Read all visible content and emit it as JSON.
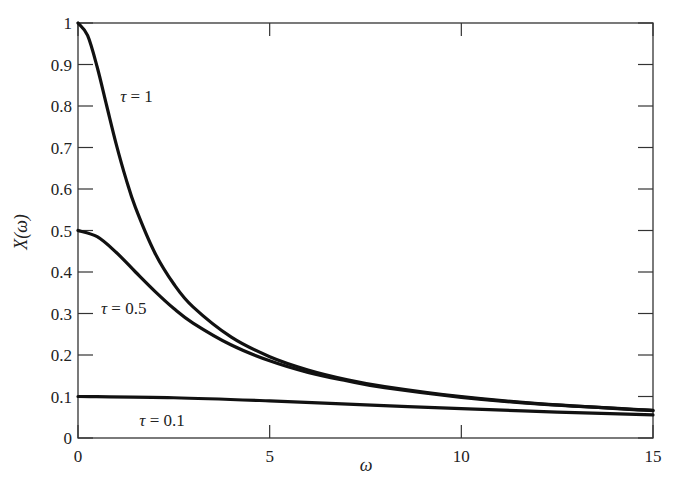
{
  "chart_data": {
    "type": "line",
    "title": "",
    "xlabel": "ω",
    "ylabel": "X(ω)",
    "xlim": [
      0,
      15
    ],
    "ylim": [
      0,
      1
    ],
    "grid": false,
    "frame": "box",
    "x_ticks": [
      0,
      5,
      10,
      15
    ],
    "x_tick_labels": [
      "0",
      "5",
      "10",
      "15"
    ],
    "y_ticks": [
      0,
      0.1,
      0.2,
      0.3,
      0.4,
      0.5,
      0.6,
      0.7,
      0.8,
      0.9,
      1
    ],
    "y_tick_labels": [
      "0",
      "0.1",
      "0.2",
      "0.3",
      "0.4",
      "0.5",
      "0.6",
      "0.7",
      "0.8",
      "0.9",
      "1"
    ],
    "legend": "inline annotations",
    "series": [
      {
        "name": "τ = 1",
        "label_text": "τ = 1",
        "color": "#111111",
        "x": [
          0,
          0.25,
          0.5,
          0.75,
          1,
          1.25,
          1.5,
          2,
          2.5,
          3,
          4,
          5,
          6,
          7,
          8,
          10,
          12,
          15
        ],
        "y": [
          1.0,
          0.97,
          0.894,
          0.8,
          0.707,
          0.625,
          0.555,
          0.447,
          0.371,
          0.316,
          0.243,
          0.196,
          0.164,
          0.141,
          0.124,
          0.0995,
          0.083,
          0.0665
        ]
      },
      {
        "name": "τ = 0.5",
        "label_text": "τ = 0.5",
        "color": "#111111",
        "x": [
          0,
          0.5,
          1,
          1.5,
          2,
          2.5,
          3,
          4,
          5,
          6,
          7,
          8,
          10,
          12,
          15
        ],
        "y": [
          0.5,
          0.485,
          0.447,
          0.4,
          0.354,
          0.312,
          0.277,
          0.224,
          0.186,
          0.158,
          0.138,
          0.121,
          0.098,
          0.082,
          0.066
        ]
      },
      {
        "name": "τ = 0.1",
        "label_text": "τ = 0.1",
        "color": "#111111",
        "x": [
          0,
          2.5,
          5,
          7.5,
          10,
          12.5,
          15
        ],
        "y": [
          0.1,
          0.097,
          0.0894,
          0.08,
          0.0707,
          0.0625,
          0.0555
        ]
      }
    ],
    "annotations": [
      {
        "text": "τ = 1",
        "x": 1.1,
        "y": 0.81
      },
      {
        "text": "τ = 0.5",
        "x": 0.6,
        "y": 0.3
      },
      {
        "text": "τ = 0.1",
        "x": 1.6,
        "y": 0.03
      }
    ]
  }
}
